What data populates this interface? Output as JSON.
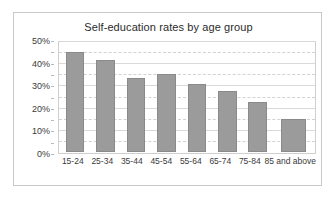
{
  "chart_data": {
    "type": "bar",
    "title": "Self-education rates by age group",
    "xlabel": "",
    "ylabel": "",
    "categories": [
      "15-24",
      "25-34",
      "35-44",
      "45-54",
      "55-64",
      "65-74",
      "75-84",
      "85 and above"
    ],
    "values": [
      46,
      42,
      34,
      36,
      31,
      28,
      23,
      15
    ],
    "ylim": [
      0,
      50
    ],
    "yticks": [
      "0%",
      "10%",
      "20%",
      "30%",
      "40%",
      "50%"
    ],
    "ytick_values": [
      0,
      10,
      20,
      30,
      40,
      50
    ],
    "minor_gridline_values": [
      5,
      15,
      25,
      35,
      45
    ],
    "grid": true,
    "legend": false,
    "series_color": "#9b9b9b",
    "series_border_color": "#8a8a8a",
    "gridline_color": "#d9d9d9",
    "frame_color": "#c8c8c8",
    "background": "#ffffff"
  }
}
